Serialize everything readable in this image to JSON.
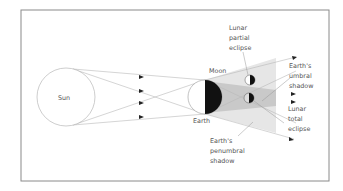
{
  "diagram": {
    "labels": {
      "sun": "Sun",
      "earth": "Earth",
      "moon": "Moon",
      "partial": [
        "Lunar",
        "partial",
        "eclipse"
      ],
      "umbral": [
        "Earth's",
        "umbral",
        "shadow"
      ],
      "total": [
        "Lunar",
        "total",
        "eclipse"
      ],
      "penumbral": [
        "Earth's",
        "penumbral",
        "shadow"
      ]
    },
    "colors": {
      "frame": "#8a8a8a",
      "line": "#b8b8b8",
      "penumbra": "#e6e6e6",
      "umbra": "#c9c9c9",
      "dark": "#111111",
      "text": "#555555"
    }
  }
}
